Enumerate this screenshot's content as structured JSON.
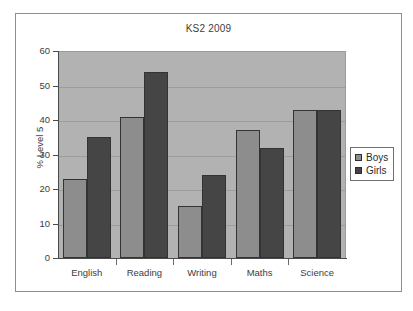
{
  "chart_data": {
    "type": "bar",
    "title": "KS2 2009",
    "xlabel": "",
    "ylabel": "% Level 5",
    "categories": [
      "English",
      "Reading",
      "Writing",
      "Maths",
      "Science"
    ],
    "series": [
      {
        "name": "Boys",
        "color": "#8d8d8d",
        "values": [
          23,
          41,
          15,
          37,
          43
        ]
      },
      {
        "name": "Girls",
        "color": "#454545",
        "values": [
          35,
          54,
          24,
          32,
          43
        ]
      }
    ],
    "ylim": [
      0,
      60
    ],
    "yticks": [
      0,
      10,
      20,
      30,
      40,
      50,
      60
    ],
    "ytick_labels": [
      "0",
      "10",
      "20",
      "30",
      "40",
      "50",
      "60"
    ],
    "grid": true,
    "legend_position": "right",
    "legend_entries": [
      "Boys",
      "Girls"
    ],
    "plot_background": "#b2b2b2"
  }
}
